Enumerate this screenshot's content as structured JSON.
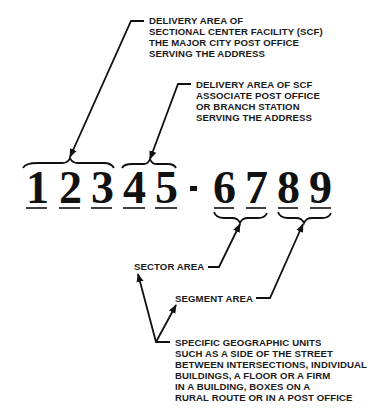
{
  "zip": {
    "digits": [
      "1",
      "2",
      "3",
      "4",
      "5"
    ],
    "separator": "-",
    "plus4": [
      "6",
      "7",
      "8",
      "9"
    ]
  },
  "annotations": {
    "scf": {
      "lines": [
        "DELIVERY AREA OF",
        "SECTIONAL CENTER FACILITY (SCF)",
        "THE MAJOR CITY POST OFFICE",
        "SERVING THE ADDRESS"
      ]
    },
    "associate": {
      "lines": [
        "DELIVERY AREA OF SCF",
        "ASSOCIATE POST OFFICE",
        "OR BRANCH STATION",
        "SERVING THE ADDRESS"
      ]
    },
    "sector": {
      "label": "SECTOR AREA"
    },
    "segment": {
      "label": "SEGMENT AREA"
    },
    "units": {
      "lines": [
        "SPECIFIC GEOGRAPHIC UNITS",
        "SUCH AS A SIDE OF THE STREET",
        "BETWEEN INTERSECTIONS, INDIVIDUAL",
        "BUILDINGS, A FLOOR OR A FIRM",
        "IN A BUILDING, BOXES ON A",
        "RURAL ROUTE OR IN A POST OFFICE"
      ]
    }
  },
  "colors": {
    "ink": "#111111",
    "background": "#ffffff"
  }
}
